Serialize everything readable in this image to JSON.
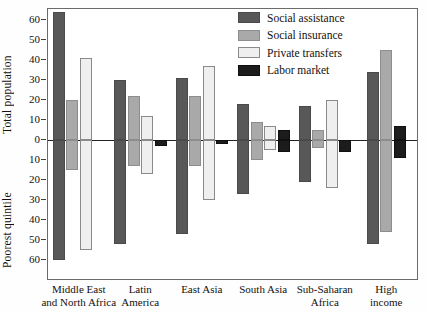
{
  "chart_data": {
    "type": "bar",
    "title": "",
    "subtitle": "",
    "orientation": "vertical-diverging",
    "grid": false,
    "legend_position": "top-right",
    "categories": [
      "Middle East and North Africa",
      "Latin America",
      "East Asia",
      "South Asia",
      "Sub-Saharan Africa",
      "High income"
    ],
    "category_lines": [
      [
        "Middle East",
        "and North Africa"
      ],
      [
        "Latin",
        "America"
      ],
      [
        "East Asia",
        ""
      ],
      [
        "South Asia",
        ""
      ],
      [
        "Sub-Saharan",
        "Africa"
      ],
      [
        "High",
        "income"
      ]
    ],
    "upper_axis": {
      "label": "Total population",
      "ticks": [
        0,
        10,
        20,
        30,
        40,
        50,
        60
      ],
      "range": [
        0,
        66
      ]
    },
    "lower_axis": {
      "label": "Poorest quintile",
      "ticks": [
        0,
        10,
        20,
        30,
        40,
        50,
        60
      ],
      "range": [
        0,
        66
      ]
    },
    "series": [
      {
        "name": "Social assistance",
        "color": "#585858",
        "total_population": [
          64,
          30,
          31,
          18,
          17,
          34
        ],
        "poorest_quintile": [
          60,
          52,
          47,
          27,
          21,
          52
        ]
      },
      {
        "name": "Social insurance",
        "color": "#a9a9a9",
        "total_population": [
          20,
          22,
          22,
          9,
          5,
          45
        ],
        "poorest_quintile": [
          15,
          13,
          13,
          10,
          4,
          46
        ]
      },
      {
        "name": "Private transfers",
        "color": "#efefef",
        "total_population": [
          41,
          12,
          37,
          7,
          20,
          null
        ],
        "poorest_quintile": [
          55,
          17,
          30,
          5,
          24,
          null
        ]
      },
      {
        "name": "Labor market",
        "color": "#1c1c1c",
        "total_population": [
          0,
          0,
          0,
          5,
          0,
          7
        ],
        "poorest_quintile": [
          0,
          3,
          2,
          6,
          6,
          9
        ]
      }
    ]
  },
  "legend": {
    "items": [
      {
        "label": "Social assistance",
        "color": "#585858"
      },
      {
        "label": "Social insurance",
        "color": "#a9a9a9"
      },
      {
        "label": "Private transfers",
        "color": "#efefef"
      },
      {
        "label": "Labor market",
        "color": "#1c1c1c"
      }
    ]
  }
}
